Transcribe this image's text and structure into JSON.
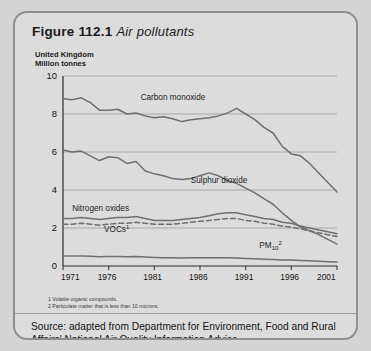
{
  "figure": {
    "number": "Figure 112.1",
    "caption": "Air pollutants",
    "region": "United Kingdom",
    "units": "Million tonnes"
  },
  "footnotes": [
    "1 Volatile organic compounds.",
    "2 Particulate matter that is less than 10 microns."
  ],
  "source": "Source: adapted from Department for Environment, Food and Rural Affairs' National Air Quality Information Advice.",
  "colors": {
    "card_bg": "#dcdcdc",
    "card_border": "#8f8f8f",
    "line": "#6f6f6f",
    "grid": "#9c9c9c",
    "axis": "#2a2a2a",
    "text": "#1b1b1b"
  },
  "chart_data": {
    "type": "line",
    "title": "Air pollutants",
    "subtitle": "United Kingdom",
    "xlabel": "",
    "ylabel": "Million tonnes",
    "xlim": [
      1971,
      2001
    ],
    "ylim": [
      0,
      10
    ],
    "yticks": [
      0,
      2,
      4,
      6,
      8,
      10
    ],
    "xticks": [
      1971,
      1976,
      1981,
      1986,
      1991,
      1996,
      2001
    ],
    "grid": "horizontal",
    "legend": "inline-labels",
    "x": [
      1971,
      1972,
      1973,
      1974,
      1975,
      1976,
      1977,
      1978,
      1979,
      1980,
      1981,
      1982,
      1983,
      1984,
      1985,
      1986,
      1987,
      1988,
      1989,
      1990,
      1991,
      1992,
      1993,
      1994,
      1995,
      1996,
      1997,
      1998,
      1999,
      2000,
      2001
    ],
    "series": [
      {
        "name": "Carbon monoxide",
        "label": "Carbon monoxide",
        "style": "solid",
        "label_xy": [
          1979.5,
          8.75
        ],
        "values": [
          8.8,
          8.75,
          8.85,
          8.6,
          8.2,
          8.2,
          8.25,
          8.0,
          8.05,
          7.9,
          7.8,
          7.85,
          7.75,
          7.6,
          7.7,
          7.75,
          7.8,
          7.9,
          8.05,
          8.3,
          8.0,
          7.7,
          7.3,
          7.0,
          6.3,
          5.9,
          5.8,
          5.4,
          4.9,
          4.4,
          3.9
        ]
      },
      {
        "name": "Sulphur dioxide",
        "label": "Sulphur dioxide",
        "style": "solid",
        "label_xy": [
          1985.0,
          4.35
        ],
        "values": [
          6.1,
          6.0,
          6.05,
          5.8,
          5.55,
          5.75,
          5.7,
          5.4,
          5.5,
          5.0,
          4.85,
          4.75,
          4.6,
          4.55,
          4.6,
          4.75,
          4.9,
          4.75,
          4.5,
          4.35,
          4.1,
          3.85,
          3.55,
          3.25,
          2.8,
          2.4,
          2.05,
          1.85,
          1.65,
          1.4,
          1.15
        ]
      },
      {
        "name": "Nitrogen oxides",
        "label": "Nitrogen oxides",
        "style": "solid",
        "label_xy": [
          1972.0,
          2.92
        ],
        "values": [
          2.5,
          2.5,
          2.55,
          2.5,
          2.45,
          2.5,
          2.55,
          2.55,
          2.6,
          2.5,
          2.4,
          2.4,
          2.4,
          2.45,
          2.5,
          2.55,
          2.65,
          2.75,
          2.8,
          2.8,
          2.7,
          2.6,
          2.5,
          2.45,
          2.3,
          2.25,
          2.1,
          2.0,
          1.9,
          1.8,
          1.7
        ]
      },
      {
        "name": "VOCs",
        "label": "VOCs",
        "label_footnote": "1",
        "style": "dashed",
        "label_xy": [
          1975.5,
          1.78
        ],
        "values": [
          2.2,
          2.2,
          2.25,
          2.2,
          2.15,
          2.2,
          2.25,
          2.25,
          2.3,
          2.25,
          2.2,
          2.2,
          2.2,
          2.25,
          2.3,
          2.35,
          2.4,
          2.45,
          2.5,
          2.5,
          2.4,
          2.35,
          2.25,
          2.2,
          2.1,
          2.05,
          1.95,
          1.85,
          1.75,
          1.65,
          1.55
        ]
      },
      {
        "name": "PM10",
        "label": "PM",
        "label_sub": "10",
        "label_footnote": "2",
        "style": "solid",
        "label_xy": [
          1992.5,
          0.95
        ],
        "values": [
          0.52,
          0.52,
          0.53,
          0.51,
          0.49,
          0.5,
          0.5,
          0.49,
          0.5,
          0.47,
          0.45,
          0.44,
          0.43,
          0.42,
          0.43,
          0.43,
          0.43,
          0.43,
          0.43,
          0.42,
          0.4,
          0.38,
          0.36,
          0.34,
          0.32,
          0.31,
          0.29,
          0.27,
          0.25,
          0.23,
          0.21
        ]
      }
    ]
  }
}
